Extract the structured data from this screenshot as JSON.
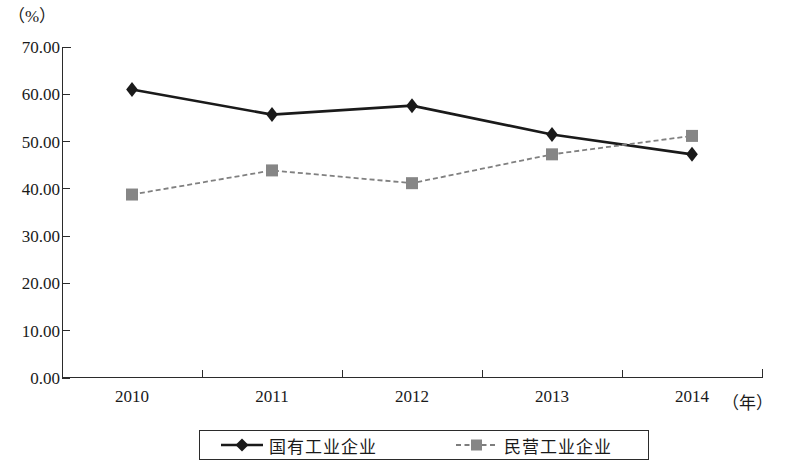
{
  "chart_data": {
    "type": "line",
    "title": "",
    "subtitle": "",
    "xlabel": "（年）",
    "ylabel": "（%）",
    "categories": [
      "2010",
      "2011",
      "2012",
      "2013",
      "2014"
    ],
    "x": [
      2010,
      2011,
      2012,
      2013,
      2014
    ],
    "series": [
      {
        "name": "国有工业企业",
        "values": [
          61.0,
          55.7,
          57.6,
          51.5,
          47.3
        ],
        "color": "#1a1a1a",
        "marker": "diamond",
        "line_style": "solid"
      },
      {
        "name": "民营工业企业",
        "values": [
          38.8,
          43.9,
          41.2,
          47.3,
          51.2
        ],
        "color": "#808080",
        "marker": "square",
        "line_style": "dashed"
      }
    ],
    "ylim": [
      0,
      70
    ],
    "ytick_labels": [
      "0.00",
      "10.00",
      "20.00",
      "30.00",
      "40.00",
      "50.00",
      "60.00",
      "70.00"
    ],
    "ytick_values": [
      0,
      10,
      20,
      30,
      40,
      50,
      60,
      70
    ],
    "grid": false,
    "legend_position": "bottom"
  },
  "axes": {
    "y_unit_label": "（%）",
    "x_unit_label": "（年）"
  },
  "legend": {
    "entries": [
      {
        "label": "国有工业企业",
        "marker": "diamond-marker",
        "color": "#1a1a1a"
      },
      {
        "label": "民营工业企业",
        "marker": "square-marker",
        "color": "#808080"
      }
    ]
  }
}
